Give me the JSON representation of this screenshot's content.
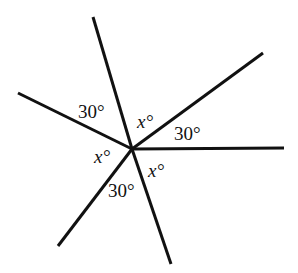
{
  "diagram": {
    "type": "angle-rays",
    "center": {
      "x": 132,
      "y": 149
    },
    "line_color": "#111111",
    "rays": [
      {
        "name": "ray-top",
        "x2": 93,
        "y2": 17
      },
      {
        "name": "ray-upper-left",
        "x2": 18,
        "y2": 93
      },
      {
        "name": "ray-upper-right",
        "x2": 263,
        "y2": 53
      },
      {
        "name": "ray-right",
        "x2": 284,
        "y2": 148
      },
      {
        "name": "ray-lower-left",
        "x2": 58,
        "y2": 246
      },
      {
        "name": "ray-bottom",
        "x2": 171,
        "y2": 264
      }
    ],
    "labels": [
      {
        "name": "angle-label-30-upper-left",
        "text": "30°",
        "x": 78,
        "y": 118,
        "italic": false
      },
      {
        "name": "angle-label-x-top",
        "text": "x°",
        "x": 137,
        "y": 128,
        "italic": true
      },
      {
        "name": "angle-label-30-right",
        "text": "30°",
        "x": 174,
        "y": 140,
        "italic": false
      },
      {
        "name": "angle-label-x-left",
        "text": "x°",
        "x": 94,
        "y": 163,
        "italic": true
      },
      {
        "name": "angle-label-x-lower-right",
        "text": "x°",
        "x": 148,
        "y": 177,
        "italic": true
      },
      {
        "name": "angle-label-30-bottom",
        "text": "30°",
        "x": 108,
        "y": 197,
        "italic": false
      }
    ]
  }
}
